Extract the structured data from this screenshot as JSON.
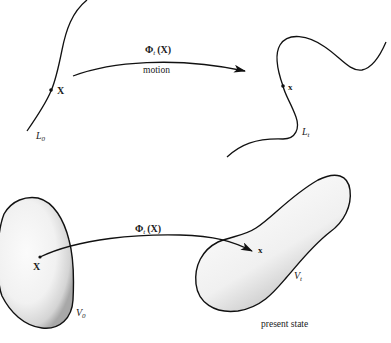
{
  "top_panel": {
    "reference_curve": {
      "name": "L",
      "subscript": "0",
      "point_label": "X"
    },
    "current_curve": {
      "name": "L",
      "subscript": "t",
      "point_label": "x"
    },
    "map_label": {
      "phi": "Φ",
      "sub": "t",
      "arg": "(X)"
    },
    "arrow_caption": "motion"
  },
  "bottom_panel": {
    "reference_body": {
      "name": "V",
      "subscript": "0",
      "point_label": "X"
    },
    "current_body": {
      "name": "V",
      "subscript": "t",
      "point_label": "x"
    },
    "map_label": {
      "phi": "Φ",
      "sub": "t",
      "arg": "(X)"
    },
    "caption": "present state"
  },
  "colors": {
    "stroke": "#111111",
    "body_fill_light": "#f7f7f7",
    "body_fill_shade": "#bdbdbd",
    "background": "#ffffff"
  }
}
